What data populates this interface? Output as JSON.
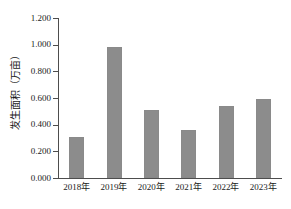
{
  "chart_data": {
    "type": "bar",
    "title": "",
    "xlabel": "",
    "ylabel": "发生面积（万亩）",
    "categories": [
      "2018年",
      "2019年",
      "2020年",
      "2021年",
      "2022年",
      "2023年"
    ],
    "values": [
      0.305,
      0.985,
      0.512,
      0.36,
      0.54,
      0.59
    ],
    "ylim": [
      0.0,
      1.2
    ],
    "ytick_values": [
      0.0,
      0.2,
      0.4,
      0.6,
      0.8,
      1.0,
      1.2
    ],
    "ytick_labels": [
      "0.000",
      "0.200",
      "0.400",
      "0.600",
      "0.800",
      "1.000",
      "1.200"
    ],
    "grid": false,
    "legend": false,
    "legend_position": "none",
    "bar_color": "#8c8c8c",
    "axis_color": "#4d4d4d",
    "text_color": "#1a1a1a",
    "background_color": "#ffffff"
  }
}
